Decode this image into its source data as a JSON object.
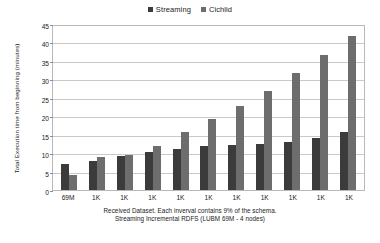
{
  "chart_data": {
    "type": "bar",
    "title": "",
    "categories": [
      "69M",
      "1K",
      "1K",
      "1K",
      "1K",
      "1K",
      "1K",
      "1K",
      "1K",
      "1K",
      "1K"
    ],
    "series": [
      {
        "name": "Streaming",
        "color": "#3b3b3b",
        "values": [
          7.0,
          8.0,
          9.3,
          10.3,
          11.0,
          11.8,
          12.2,
          12.6,
          13.0,
          14.2,
          15.6
        ]
      },
      {
        "name": "Cichlid",
        "color": "#6d6d6d",
        "values": [
          4.2,
          9.0,
          9.5,
          11.8,
          15.6,
          19.3,
          22.7,
          26.8,
          31.6,
          36.7,
          41.8
        ]
      }
    ],
    "xlabel": "",
    "ylabel": "Total Execution time from beginning (minutes)",
    "ylim": [
      0,
      45
    ],
    "ytick_values": [
      0,
      5,
      10,
      15,
      20,
      25,
      30,
      35,
      40,
      45
    ],
    "ytick_labels": [
      "0",
      "5",
      "10",
      "15",
      "20",
      "25",
      "30",
      "35",
      "40",
      "45"
    ],
    "grid": true,
    "legend_position": "top-center",
    "caption": [
      "Received Dataset. Each inverval contains 9% of the schema.",
      "Streaming Incremental RDFS (LUBM 69M - 4 nodes)"
    ]
  }
}
